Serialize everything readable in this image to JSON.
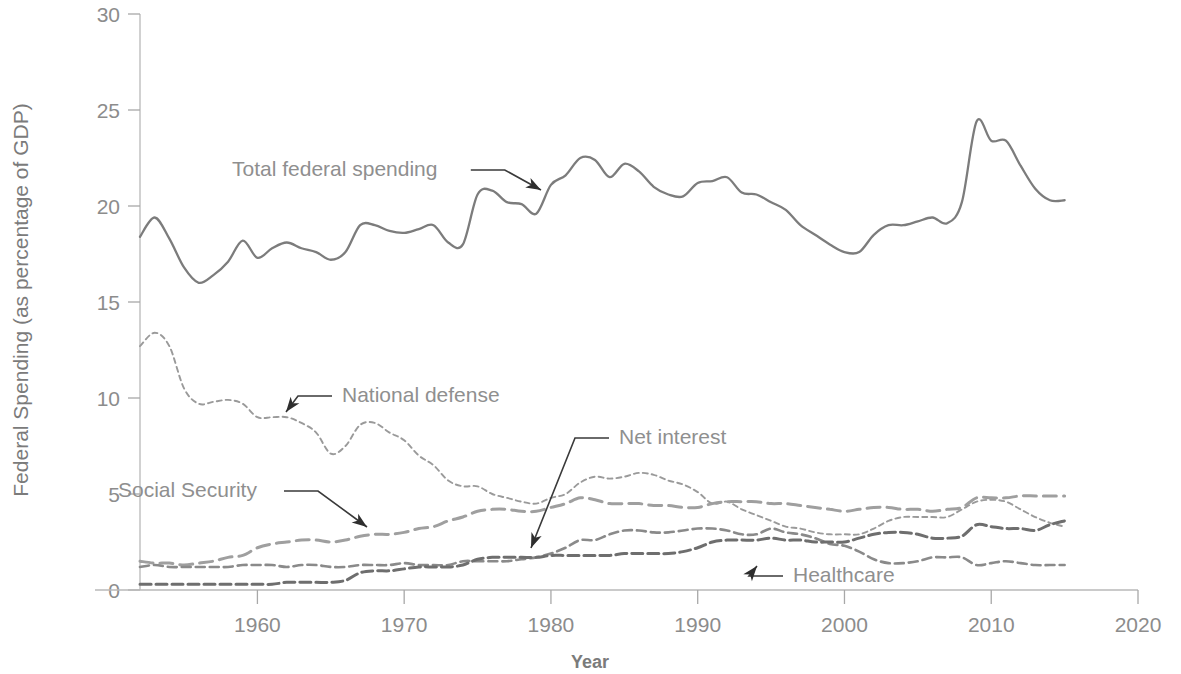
{
  "chart_data": {
    "type": "line",
    "title": "",
    "xlabel": "Year",
    "ylabel": "Federal Spending (as percentage of GDP)",
    "xlim": [
      1952,
      2020
    ],
    "ylim": [
      0,
      30
    ],
    "xticks": [
      "1960",
      "1970",
      "1980",
      "1990",
      "2000",
      "2010",
      "2020"
    ],
    "xtick_values": [
      1960,
      1970,
      1980,
      1990,
      2000,
      2010,
      2020
    ],
    "yticks": [
      "0",
      "5",
      "10",
      "15",
      "20",
      "25",
      "30"
    ],
    "ytick_values": [
      0,
      5,
      10,
      15,
      20,
      25,
      30
    ],
    "grid": false,
    "legend": "inline-annotations",
    "x": [
      1952,
      1953,
      1954,
      1955,
      1956,
      1957,
      1958,
      1959,
      1960,
      1961,
      1962,
      1963,
      1964,
      1965,
      1966,
      1967,
      1968,
      1969,
      1970,
      1971,
      1972,
      1973,
      1974,
      1975,
      1976,
      1977,
      1978,
      1979,
      1980,
      1981,
      1982,
      1983,
      1984,
      1985,
      1986,
      1987,
      1988,
      1989,
      1990,
      1991,
      1992,
      1993,
      1994,
      1995,
      1996,
      1997,
      1998,
      1999,
      2000,
      2001,
      2002,
      2003,
      2004,
      2005,
      2006,
      2007,
      2008,
      2009,
      2010,
      2011,
      2012,
      2013,
      2014,
      2015
    ],
    "series": [
      {
        "name": "Total federal spending",
        "style": "solid",
        "color": "#7c7c7c",
        "values": [
          18.4,
          19.4,
          18.3,
          16.8,
          16.0,
          16.4,
          17.1,
          18.2,
          17.3,
          17.8,
          18.1,
          17.8,
          17.6,
          17.2,
          17.6,
          19.0,
          19.0,
          18.7,
          18.6,
          18.8,
          19.0,
          18.1,
          18.0,
          20.6,
          20.8,
          20.2,
          20.1,
          19.6,
          21.1,
          21.6,
          22.5,
          22.4,
          21.5,
          22.2,
          21.8,
          21.0,
          20.6,
          20.5,
          21.2,
          21.3,
          21.5,
          20.7,
          20.6,
          20.2,
          19.8,
          19.0,
          18.5,
          18.0,
          17.6,
          17.6,
          18.5,
          19.0,
          19.0,
          19.2,
          19.4,
          19.1,
          20.2,
          24.4,
          23.4,
          23.4,
          22.1,
          20.9,
          20.3,
          20.3
        ]
      },
      {
        "name": "National defense",
        "style": "dotted-fine",
        "color": "#9a9a9a",
        "values": [
          12.7,
          13.4,
          12.7,
          10.5,
          9.7,
          9.8,
          9.9,
          9.7,
          9.0,
          9.0,
          9.0,
          8.7,
          8.2,
          7.1,
          7.5,
          8.6,
          8.7,
          8.2,
          7.8,
          7.0,
          6.5,
          5.7,
          5.4,
          5.4,
          5.0,
          4.8,
          4.6,
          4.5,
          4.8,
          5.0,
          5.6,
          5.9,
          5.8,
          5.9,
          6.1,
          6.0,
          5.7,
          5.5,
          5.1,
          4.5,
          4.6,
          4.2,
          3.9,
          3.6,
          3.3,
          3.2,
          3.0,
          2.9,
          2.9,
          2.9,
          3.2,
          3.6,
          3.8,
          3.8,
          3.8,
          3.8,
          4.2,
          4.6,
          4.7,
          4.6,
          4.2,
          3.8,
          3.5,
          3.3
        ]
      },
      {
        "name": "Social Security",
        "style": "dashed-long",
        "color": "#9f9f9f",
        "values": [
          1.5,
          1.4,
          1.4,
          1.3,
          1.4,
          1.5,
          1.7,
          1.8,
          2.2,
          2.4,
          2.5,
          2.6,
          2.6,
          2.5,
          2.6,
          2.8,
          2.9,
          2.9,
          3.0,
          3.2,
          3.3,
          3.6,
          3.8,
          4.1,
          4.2,
          4.2,
          4.1,
          4.1,
          4.3,
          4.5,
          4.8,
          4.7,
          4.5,
          4.5,
          4.5,
          4.4,
          4.4,
          4.3,
          4.3,
          4.5,
          4.6,
          4.6,
          4.6,
          4.5,
          4.5,
          4.4,
          4.3,
          4.2,
          4.1,
          4.2,
          4.3,
          4.3,
          4.2,
          4.2,
          4.1,
          4.2,
          4.3,
          4.8,
          4.8,
          4.8,
          4.9,
          4.9,
          4.9,
          4.9
        ]
      },
      {
        "name": "Net interest",
        "style": "dashed-medium",
        "color": "#8a8a8a",
        "values": [
          1.2,
          1.3,
          1.2,
          1.2,
          1.2,
          1.2,
          1.2,
          1.3,
          1.3,
          1.3,
          1.2,
          1.3,
          1.3,
          1.2,
          1.2,
          1.3,
          1.3,
          1.3,
          1.4,
          1.3,
          1.3,
          1.3,
          1.5,
          1.5,
          1.5,
          1.5,
          1.6,
          1.7,
          1.9,
          2.2,
          2.6,
          2.6,
          2.9,
          3.1,
          3.1,
          3.0,
          3.0,
          3.1,
          3.2,
          3.2,
          3.1,
          2.9,
          2.9,
          3.2,
          3.0,
          2.9,
          2.7,
          2.4,
          2.3,
          2.0,
          1.6,
          1.4,
          1.4,
          1.5,
          1.7,
          1.7,
          1.7,
          1.3,
          1.4,
          1.5,
          1.4,
          1.3,
          1.3,
          1.3
        ]
      },
      {
        "name": "Healthcare",
        "style": "dashed-short",
        "color": "#6e6e6e",
        "values": [
          0.3,
          0.3,
          0.3,
          0.3,
          0.3,
          0.3,
          0.3,
          0.3,
          0.3,
          0.3,
          0.4,
          0.4,
          0.4,
          0.4,
          0.5,
          0.9,
          1.0,
          1.0,
          1.1,
          1.2,
          1.2,
          1.2,
          1.3,
          1.6,
          1.7,
          1.7,
          1.7,
          1.7,
          1.8,
          1.8,
          1.8,
          1.8,
          1.8,
          1.9,
          1.9,
          1.9,
          1.9,
          2.0,
          2.2,
          2.5,
          2.6,
          2.6,
          2.6,
          2.7,
          2.6,
          2.6,
          2.5,
          2.5,
          2.5,
          2.7,
          2.9,
          3.0,
          3.0,
          2.9,
          2.7,
          2.7,
          2.8,
          3.4,
          3.3,
          3.2,
          3.2,
          3.1,
          3.4,
          3.6
        ]
      }
    ],
    "annotations": [
      {
        "text": "Total federal spending",
        "label_x": 232,
        "label_y": 176,
        "tip_x": 541,
        "tip_y": 190
      },
      {
        "text": "National defense",
        "label_x": 342,
        "label_y": 402,
        "tip_x": 286,
        "tip_y": 412
      },
      {
        "text": "Net interest",
        "label_x": 619,
        "label_y": 444,
        "tip_x": 531,
        "tip_y": 548
      },
      {
        "text": "Social Security",
        "label_x": 118,
        "label_y": 497,
        "tip_x": 367,
        "tip_y": 527
      },
      {
        "text": "Healthcare",
        "label_x": 793,
        "label_y": 582,
        "tip_x": 757,
        "tip_y": 566
      }
    ]
  }
}
